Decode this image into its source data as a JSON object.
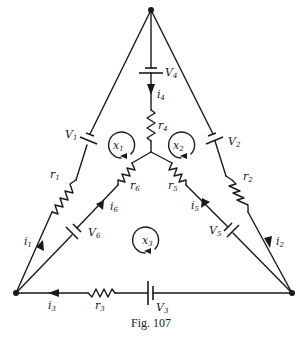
{
  "figure": {
    "caption": "Fig. 107",
    "nodes": [
      "top",
      "bottom-left",
      "bottom-right",
      "center"
    ],
    "branches": [
      {
        "id": "left",
        "from": "bottom-left",
        "to": "top",
        "battery": "V1",
        "resistor": "r1",
        "current": "i1"
      },
      {
        "id": "right",
        "from": "top",
        "to": "bottom-right",
        "battery": "V2",
        "resistor": "r2",
        "current": "i2"
      },
      {
        "id": "bottom",
        "from": "bottom-right",
        "to": "bottom-left",
        "battery": "V3",
        "resistor": "r3",
        "current": "i3"
      },
      {
        "id": "vertical",
        "from": "top",
        "to": "center",
        "battery": "V4",
        "resistor": "r4",
        "current": "i4"
      },
      {
        "id": "inner-right",
        "from": "bottom-right",
        "to": "center",
        "battery": "V5",
        "resistor": "r5",
        "current": "i5"
      },
      {
        "id": "inner-left",
        "from": "bottom-left",
        "to": "center",
        "battery": "V6",
        "resistor": "r6",
        "current": "i6"
      }
    ],
    "loops": [
      {
        "id": "x1",
        "direction": "clockwise"
      },
      {
        "id": "x2",
        "direction": "clockwise"
      },
      {
        "id": "x3",
        "direction": "clockwise"
      }
    ]
  },
  "labels": {
    "V1": {
      "base": "V",
      "sub": "1"
    },
    "V2": {
      "base": "V",
      "sub": "2"
    },
    "V3": {
      "base": "V",
      "sub": "3"
    },
    "V4": {
      "base": "V",
      "sub": "4"
    },
    "V5": {
      "base": "V",
      "sub": "5"
    },
    "V6": {
      "base": "V",
      "sub": "6"
    },
    "r1": {
      "base": "r",
      "sub": "1"
    },
    "r2": {
      "base": "r",
      "sub": "2"
    },
    "r3": {
      "base": "r",
      "sub": "3"
    },
    "r4": {
      "base": "r",
      "sub": "4"
    },
    "r5": {
      "base": "r",
      "sub": "5"
    },
    "r6": {
      "base": "r",
      "sub": "6"
    },
    "i1": {
      "base": "i",
      "sub": "1"
    },
    "i2": {
      "base": "i",
      "sub": "2"
    },
    "i3": {
      "base": "i",
      "sub": "3"
    },
    "i4": {
      "base": "i",
      "sub": "4"
    },
    "i5": {
      "base": "i",
      "sub": "5"
    },
    "i6": {
      "base": "i",
      "sub": "6"
    },
    "x1": {
      "base": "x",
      "sub": "1"
    },
    "x2": {
      "base": "x",
      "sub": "2"
    },
    "x3": {
      "base": "x",
      "sub": "3"
    }
  }
}
